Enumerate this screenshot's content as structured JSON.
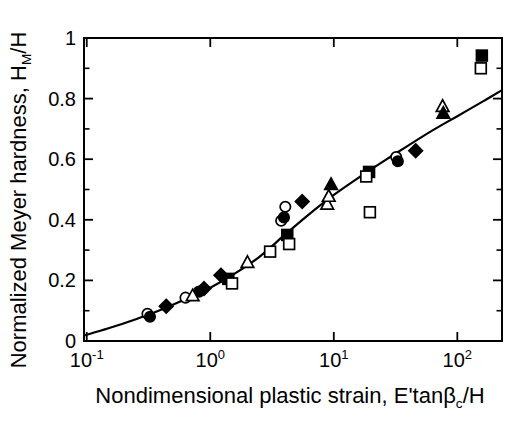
{
  "figure": {
    "background": "#ffffff",
    "ink_color": "#000000"
  },
  "chart_data": {
    "type": "scatter",
    "title": "",
    "x_scale": "log",
    "xlim": [
      0.095,
      230
    ],
    "ylim": [
      0,
      1
    ],
    "grid": false,
    "legend": "none",
    "xlabel": {
      "text": "Nondimensional plastic strain, E'tanβc/H",
      "main": "Nondimensional plastic strain, E'tanβ",
      "sub": "c",
      "suffix": "/H"
    },
    "ylabel": {
      "text": "Normalized Meyer hardness, HM/H",
      "main": "Normalized Meyer hardness, H",
      "sub": "M",
      "suffix": "/H"
    },
    "x_ticks": [
      {
        "base": "10",
        "exp": "-1",
        "value": 0.1
      },
      {
        "base": "10",
        "exp": "0",
        "value": 1
      },
      {
        "base": "10",
        "exp": "1",
        "value": 10
      },
      {
        "base": "10",
        "exp": "2",
        "value": 100
      }
    ],
    "y_ticks": [
      {
        "label": "0",
        "value": 0
      },
      {
        "label": "0.2",
        "value": 0.2
      },
      {
        "label": "0.4",
        "value": 0.4
      },
      {
        "label": "0.6",
        "value": 0.6
      },
      {
        "label": "0.8",
        "value": 0.8
      },
      {
        "label": "1",
        "value": 1
      }
    ],
    "y_minor_ticks": [
      0.1,
      0.2,
      0.3,
      0.4,
      0.5,
      0.6,
      0.7,
      0.8,
      0.9
    ],
    "series": [
      {
        "name": "open-circle",
        "marker": "circle",
        "fill": "open",
        "points": [
          [
            0.31,
            0.09
          ],
          [
            0.63,
            0.143
          ],
          [
            3.75,
            0.397
          ],
          [
            4.05,
            0.443
          ],
          [
            32,
            0.607
          ]
        ]
      },
      {
        "name": "filled-circle",
        "marker": "circle",
        "fill": "filled",
        "points": [
          [
            0.325,
            0.08
          ],
          [
            0.81,
            0.163
          ],
          [
            3.95,
            0.408
          ],
          [
            33,
            0.593
          ]
        ]
      },
      {
        "name": "filled-diamond",
        "marker": "diamond",
        "fill": "filled",
        "points": [
          [
            0.44,
            0.115
          ],
          [
            0.89,
            0.173
          ],
          [
            1.22,
            0.217
          ],
          [
            5.55,
            0.46
          ],
          [
            46,
            0.628
          ]
        ]
      },
      {
        "name": "open-triangle",
        "marker": "triangle",
        "fill": "open",
        "points": [
          [
            0.72,
            0.15
          ],
          [
            2.0,
            0.26
          ],
          [
            8.85,
            0.452
          ],
          [
            9.1,
            0.478
          ],
          [
            76,
            0.775
          ]
        ]
      },
      {
        "name": "filled-triangle",
        "marker": "triangle",
        "fill": "filled",
        "points": [
          [
            9.5,
            0.517
          ],
          [
            77,
            0.752
          ]
        ]
      },
      {
        "name": "filled-square",
        "marker": "square",
        "fill": "filled",
        "points": [
          [
            1.4,
            0.205
          ],
          [
            4.2,
            0.35
          ],
          [
            19.3,
            0.558
          ],
          [
            158,
            0.942
          ]
        ]
      },
      {
        "name": "open-square",
        "marker": "square",
        "fill": "open",
        "points": [
          [
            1.5,
            0.19
          ],
          [
            3.05,
            0.295
          ],
          [
            4.35,
            0.32
          ],
          [
            18.3,
            0.543
          ],
          [
            19.6,
            0.425
          ],
          [
            155,
            0.9
          ]
        ]
      }
    ],
    "fit_curve": {
      "name": "model-curve",
      "points": [
        [
          0.095,
          0.018
        ],
        [
          0.15,
          0.042
        ],
        [
          0.25,
          0.072
        ],
        [
          0.4,
          0.103
        ],
        [
          0.63,
          0.138
        ],
        [
          1.0,
          0.176
        ],
        [
          1.6,
          0.224
        ],
        [
          2.5,
          0.278
        ],
        [
          4.0,
          0.35
        ],
        [
          6.3,
          0.418
        ],
        [
          10,
          0.482
        ],
        [
          16,
          0.54
        ],
        [
          25,
          0.592
        ],
        [
          40,
          0.645
        ],
        [
          63,
          0.695
        ],
        [
          100,
          0.742
        ],
        [
          160,
          0.79
        ],
        [
          230,
          0.828
        ]
      ]
    }
  }
}
